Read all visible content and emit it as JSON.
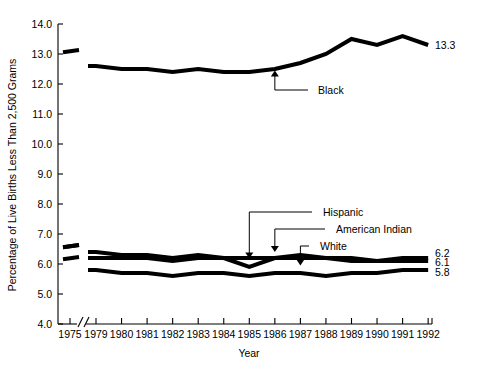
{
  "chart_data": {
    "type": "line",
    "title": "",
    "xlabel": "Year",
    "ylabel": "Percentage of Live Births Less Than 2,500 Grams",
    "xlim": [
      1975,
      1992
    ],
    "ylim": [
      4.0,
      14.0
    ],
    "axis_break": "between 1975 and 1979",
    "grid": false,
    "legend": "inline annotations with arrows",
    "x_tick_labels": [
      "1975",
      "1979",
      "1980",
      "1981",
      "1982",
      "1983",
      "1984",
      "1985",
      "1986",
      "1987",
      "1988",
      "1989",
      "1990",
      "1991",
      "1992"
    ],
    "y_tick_labels": [
      "4.0",
      "5.0",
      "6.0",
      "7.0",
      "8.0",
      "9.0",
      "10.0",
      "11.0",
      "12.0",
      "13.0",
      "14.0"
    ],
    "x": [
      1975,
      1979,
      1980,
      1981,
      1982,
      1983,
      1984,
      1985,
      1986,
      1987,
      1988,
      1989,
      1990,
      1991,
      1992
    ],
    "series": [
      {
        "name": "Black",
        "label": "Black",
        "end_label": "13.3",
        "values": [
          13.1,
          12.6,
          12.5,
          12.5,
          12.4,
          12.5,
          12.4,
          12.4,
          12.5,
          12.7,
          13.0,
          13.5,
          13.3,
          13.6,
          13.3
        ]
      },
      {
        "name": "Hispanic",
        "label": "Hispanic",
        "end_label": "6.2",
        "values": [
          6.6,
          6.4,
          6.3,
          6.3,
          6.2,
          6.3,
          6.2,
          5.9,
          6.2,
          6.3,
          6.2,
          6.2,
          6.1,
          6.2,
          6.2
        ]
      },
      {
        "name": "American Indian",
        "label": "American Indian",
        "end_label": "6.1",
        "values": [
          6.6,
          6.2,
          6.2,
          6.2,
          6.1,
          6.2,
          6.2,
          6.2,
          6.2,
          6.2,
          6.2,
          6.1,
          6.1,
          6.1,
          6.1
        ]
      },
      {
        "name": "White",
        "label": "White",
        "end_label": "5.8",
        "values": [
          6.2,
          5.8,
          5.7,
          5.7,
          5.6,
          5.7,
          5.7,
          5.6,
          5.7,
          5.7,
          5.6,
          5.7,
          5.7,
          5.8,
          5.8
        ]
      }
    ],
    "annotations": [
      {
        "text": "Black",
        "points_to": "black-line",
        "at_year": 1986
      },
      {
        "text": "Hispanic",
        "points_to": "hispanic-line",
        "at_year": 1985
      },
      {
        "text": "American Indian",
        "points_to": "american-indian-line",
        "at_year": 1986
      },
      {
        "text": "White",
        "points_to": "white-line",
        "at_year": 1987
      }
    ]
  }
}
